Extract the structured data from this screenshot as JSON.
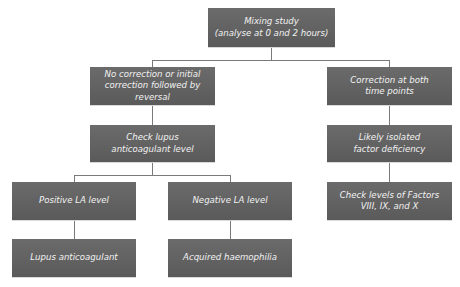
{
  "diagram": {
    "nodes": {
      "root": {
        "label": "Mixing study\n(analyse at 0 and 2 hours)",
        "line1": "Mixing study",
        "line2": "(analyse at 0 and 2 hours)"
      },
      "no_correction": {
        "label": "No correction or initial correction followed by reversal"
      },
      "check_la": {
        "label": "Check lupus anticoagulant level"
      },
      "positive_la": {
        "label": "Positive LA level"
      },
      "negative_la": {
        "label": "Negative LA level"
      },
      "lupus_anticoagulant": {
        "label": "Lupus anticoagulant"
      },
      "acquired_haemophilia": {
        "label": "Acquired haemophilia"
      },
      "correction_both": {
        "label": "Correction at both time points"
      },
      "isolated_factor": {
        "label": "Likely isolated factor deficiency"
      },
      "check_factors": {
        "label": "Check levels of Factors VIII, IX, and X"
      }
    },
    "edges": [
      [
        "root",
        "no_correction"
      ],
      [
        "root",
        "correction_both"
      ],
      [
        "no_correction",
        "check_la"
      ],
      [
        "check_la",
        "positive_la"
      ],
      [
        "check_la",
        "negative_la"
      ],
      [
        "positive_la",
        "lupus_anticoagulant"
      ],
      [
        "negative_la",
        "acquired_haemophilia"
      ],
      [
        "correction_both",
        "isolated_factor"
      ],
      [
        "isolated_factor",
        "check_factors"
      ]
    ],
    "colors": {
      "box_fill": "#636363",
      "box_text": "#f2f2f2",
      "connector": "#7a7a7a",
      "background": "#ffffff"
    }
  }
}
